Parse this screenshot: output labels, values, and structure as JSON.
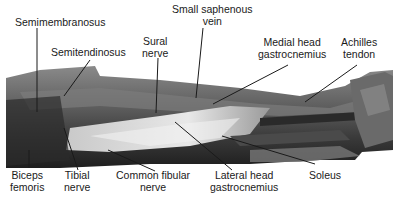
{
  "figure": {
    "type": "anatomical-photo",
    "labels": {
      "semimembranosus": "Semimembranosus",
      "semitendinosus": "Semitendinosus",
      "sural_nerve_1": "Sural",
      "sural_nerve_2": "nerve",
      "small_saphenous_1": "Small saphenous",
      "small_saphenous_2": "vein",
      "medial_head_1": "Medial head",
      "medial_head_2": "gastrocnemius",
      "achilles_1": "Achilles",
      "achilles_2": "tendon",
      "biceps_1": "Biceps",
      "biceps_2": "femoris",
      "tibial_1": "Tibial",
      "tibial_2": "nerve",
      "common_fibular_1": "Common fibular",
      "common_fibular_2": "nerve",
      "lateral_head_1": "Lateral head",
      "lateral_head_2": "gastrocnemius",
      "soleus": "Soleus"
    },
    "colors": {
      "line": "#1a1a1a",
      "text": "#1a1a1a"
    }
  }
}
